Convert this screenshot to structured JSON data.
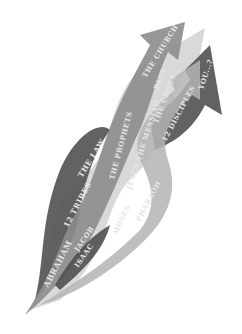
{
  "colors": {
    "background": "#ffffff",
    "dark_band": "#5a5a5a",
    "mid_band": "#8c8c8c",
    "light_band": "#b4b4b4",
    "pale_band": "#d2d2d2",
    "label": "#e6e6e6"
  },
  "labels": [
    {
      "id": "abraham",
      "text": "ABRAHAM"
    },
    {
      "id": "isaac",
      "text": "ISAAC"
    },
    {
      "id": "jacob",
      "text": "JACOB"
    },
    {
      "id": "12tribes",
      "text": "12 TRIBES"
    },
    {
      "id": "moses",
      "text": "MOSES"
    },
    {
      "id": "pharaoh",
      "text": "PHARAOH"
    },
    {
      "id": "thelaw",
      "text": "THE LAW"
    },
    {
      "id": "theprophets",
      "text": "THE PROPHETS"
    },
    {
      "id": "jesus",
      "text": "JESUS THE MESSIAH"
    },
    {
      "id": "thecross",
      "text": "THE CROSS"
    },
    {
      "id": "12disciples",
      "text": "12 DISCIPLES"
    },
    {
      "id": "paul",
      "text": "PAUL"
    },
    {
      "id": "thechurch",
      "text": "THE CHURCH"
    },
    {
      "id": "you",
      "text": "YOU...?"
    }
  ]
}
